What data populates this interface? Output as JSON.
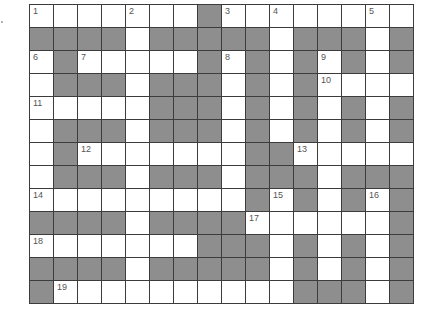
{
  "puzzle": {
    "type": "crossword",
    "rows": 13,
    "cols": 16,
    "colors": {
      "block": "#8e8e8e",
      "open": "#ffffff",
      "line": "#3c3c3c",
      "number": "#555555"
    },
    "layout": [
      "....._..#.......",
      "####.#####.###.#",
      ".#.....#.#.#.#.#",
      ".###.###.#.#....",
      ".....###.#.#.#.#",
      ".###.###.#.#.#.#",
      ".#......##.....",
      ".###.###.###.###",
      ".........#.#.#.#",
      "####.####......#",
      ".......###.#.#.#",
      "####.#####.#.#.#",
      "#..........###.#"
    ],
    "grid": [
      "WWWWWWWBWWWWWWWW",
      "BBBBWBBBBBWBBBWB",
      "WBWWWWWBWBWBWBWB",
      "WBBBWBBBWBWBWWWW",
      "WWWWWBBBWBWBWBWB",
      "WBBBWBBBWBWBWBWB",
      "WBWWWWWWWBBWWWWW",
      "WBBBWBBBWBBBWBBB",
      "WWWWWWWWWBWBWBWB",
      "BBBBWBBBBWWWWWWB",
      "WWWWWWWBBBWBWBWB",
      "BBBBWBBBBBWBWBWB",
      "BWWWWWWWWWWBBBWB"
    ],
    "numbers": [
      {
        "n": "1",
        "r": 0,
        "c": 0
      },
      {
        "n": "2",
        "r": 0,
        "c": 4
      },
      {
        "n": "3",
        "r": 0,
        "c": 8
      },
      {
        "n": "4",
        "r": 0,
        "c": 10
      },
      {
        "n": "5",
        "r": 0,
        "c": 14
      },
      {
        "n": "6",
        "r": 2,
        "c": 0
      },
      {
        "n": "7",
        "r": 2,
        "c": 2
      },
      {
        "n": "8",
        "r": 2,
        "c": 8
      },
      {
        "n": "9",
        "r": 2,
        "c": 12
      },
      {
        "n": "10",
        "r": 3,
        "c": 12
      },
      {
        "n": "11",
        "r": 4,
        "c": 0
      },
      {
        "n": "12",
        "r": 6,
        "c": 2
      },
      {
        "n": "13",
        "r": 6,
        "c": 11
      },
      {
        "n": "14",
        "r": 8,
        "c": 0
      },
      {
        "n": "15",
        "r": 8,
        "c": 10
      },
      {
        "n": "16",
        "r": 8,
        "c": 14
      },
      {
        "n": "17",
        "r": 9,
        "c": 9
      },
      {
        "n": "18",
        "r": 10,
        "c": 0
      },
      {
        "n": "19",
        "r": 12,
        "c": 1
      }
    ]
  }
}
